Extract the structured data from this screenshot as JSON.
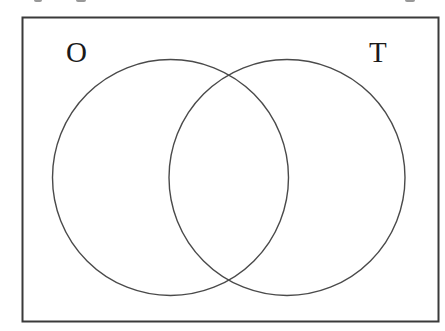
{
  "diagram": {
    "type": "venn",
    "sets": [
      {
        "label": "O",
        "cx": 170.5,
        "cy": 177.5,
        "r": 118
      },
      {
        "label": "T",
        "cx": 287,
        "cy": 177.5,
        "r": 118
      }
    ],
    "labels": {
      "left": "O",
      "right": "T"
    },
    "frame": {
      "x": 22.5,
      "y": 17.5,
      "width": 416,
      "height": 304
    },
    "colors": {
      "stroke": "#4a4a4a",
      "frame": "#3a3a3a",
      "background": "#ffffff"
    }
  }
}
